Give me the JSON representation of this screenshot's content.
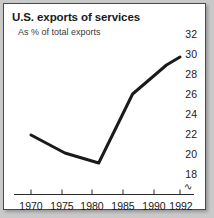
{
  "figure": {
    "background_color": "#c9c9c9",
    "panel_color": "#ffffff",
    "border_color": "#4a4a4a",
    "line_color": "#1a1a1a"
  },
  "chart_data": {
    "type": "line",
    "title": "U.S. exports of services",
    "subtitle": "As % of total exports",
    "xlabel": "",
    "ylabel": "",
    "x": [
      1970,
      1975,
      1980,
      1985,
      1990,
      1992
    ],
    "values": [
      21.9,
      20.1,
      19.1,
      26.0,
      28.9,
      29.7
    ],
    "series": [
      {
        "name": "U.S. exports of services as % of total exports",
        "values": [
          21.9,
          20.1,
          19.1,
          26.0,
          28.9,
          29.7
        ]
      }
    ],
    "xlim": [
      1970,
      1992
    ],
    "ylim": [
      18,
      32
    ],
    "xticks": [
      1970,
      1975,
      1980,
      1985,
      1990,
      1992
    ],
    "xtick_labels": [
      "1970",
      "1975",
      "1980",
      "1985",
      "1990",
      "1992"
    ],
    "yticks": [
      18,
      20,
      22,
      24,
      26,
      28,
      30,
      32
    ],
    "ytick_labels": [
      "18",
      "20",
      "22",
      "24",
      "26",
      "28",
      "30",
      "32"
    ],
    "ytick_side": "right",
    "grid": false,
    "legend": "none",
    "axis_break_symbol": "∿",
    "axis_break_note": "y-axis broken below 18"
  }
}
